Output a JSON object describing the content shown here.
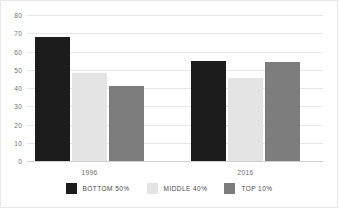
{
  "chart_data": {
    "type": "bar",
    "title": "",
    "subtitle": "",
    "xlabel": "",
    "ylabel": "",
    "categories": [
      "1996",
      "2016"
    ],
    "series": [
      {
        "name": "BOTTOM 50%",
        "color": "#1c1c1c",
        "values": [
          68,
          55
        ]
      },
      {
        "name": "MIDDLE 40%",
        "color": "#e4e4e4",
        "values": [
          48,
          45.5
        ]
      },
      {
        "name": "TOP 10%",
        "color": "#7d7d7d",
        "values": [
          41,
          54
        ]
      }
    ],
    "ylim": [
      0,
      80
    ],
    "ytick_values": [
      0,
      10,
      20,
      30,
      40,
      50,
      60,
      70,
      80
    ],
    "ytick_labels": [
      "0",
      "10",
      "20",
      "30",
      "40",
      "50",
      "60",
      "70",
      "80"
    ],
    "grid": true,
    "grid_color": "#e6e6e6",
    "legend_position": "bottom-center",
    "annotations": []
  },
  "axis": {
    "y_labels": [
      "80",
      "70",
      "60",
      "50",
      "40",
      "30",
      "20",
      "10",
      "0"
    ],
    "x_labels": [
      "1996",
      "2016"
    ]
  },
  "legend": {
    "entries": [
      {
        "label": "BOTTOM 50%",
        "color": "#1c1c1c"
      },
      {
        "label": "MIDDLE 40%",
        "color": "#e4e4e4"
      },
      {
        "label": "TOP 10%",
        "color": "#7d7d7d"
      }
    ]
  }
}
